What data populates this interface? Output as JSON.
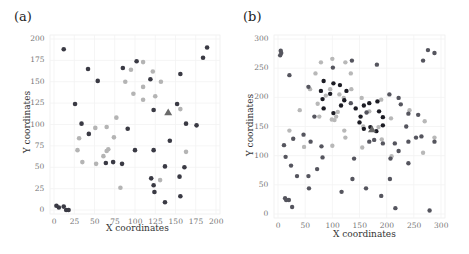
{
  "chart_data": [
    {
      "panel": "(a)",
      "type": "scatter",
      "title": "",
      "xlabel": "X coordinates",
      "ylabel": "Y coordinates",
      "xlim": [
        0,
        200
      ],
      "ylim": [
        0,
        200
      ],
      "xticks": [
        "0",
        "25",
        "50",
        "75",
        "100",
        "125",
        "150",
        "175",
        "200"
      ],
      "yticks": [
        "0",
        "25",
        "50",
        "75",
        "100",
        "125",
        "150",
        "175",
        "200"
      ],
      "grid": true,
      "legend": null,
      "colors": {
        "dark": "#3a3a44",
        "light": "#b4b4b4",
        "triangle": "#6a6a6a"
      },
      "series": [
        {
          "name": "dark",
          "marker": "circle",
          "points": [
            [
              12,
              188
            ],
            [
              42,
              165
            ],
            [
              54,
              151
            ],
            [
              26,
              124
            ],
            [
              34,
              101
            ],
            [
              43,
              89
            ],
            [
              102,
              174
            ],
            [
              85,
              166
            ],
            [
              91,
              95
            ],
            [
              100,
              70
            ],
            [
              64,
              55
            ],
            [
              73,
              56
            ],
            [
              84,
              54
            ],
            [
              119,
              153
            ],
            [
              123,
              117
            ],
            [
              156,
              159
            ],
            [
              152,
              124
            ],
            [
              163,
              101
            ],
            [
              176,
              99
            ],
            [
              143,
              81
            ],
            [
              123,
              70
            ],
            [
              137,
              51
            ],
            [
              120,
              37
            ],
            [
              123,
              29
            ],
            [
              124,
              21
            ],
            [
              137,
              9
            ],
            [
              155,
              39
            ],
            [
              161,
              50
            ],
            [
              156,
              16
            ],
            [
              184,
              178
            ],
            [
              189,
              190
            ],
            [
              3,
              5
            ],
            [
              6,
              3
            ],
            [
              12,
              4
            ],
            [
              15,
              0
            ],
            [
              18,
              0
            ]
          ]
        },
        {
          "name": "light",
          "marker": "circle",
          "points": [
            [
              110,
              173
            ],
            [
              95,
              164
            ],
            [
              122,
              162
            ],
            [
              88,
              150
            ],
            [
              110,
              144
            ],
            [
              132,
              150
            ],
            [
              98,
              136
            ],
            [
              110,
              129
            ],
            [
              125,
              133
            ],
            [
              156,
              118
            ],
            [
              77,
              108
            ],
            [
              51,
              96
            ],
            [
              65,
              97
            ],
            [
              31,
              84
            ],
            [
              74,
              85
            ],
            [
              29,
              70
            ],
            [
              67,
              71
            ],
            [
              65,
              69
            ],
            [
              61,
              63
            ],
            [
              35,
              56
            ],
            [
              52,
              54
            ],
            [
              163,
              68
            ],
            [
              131,
              35
            ],
            [
              82,
              26
            ]
          ]
        },
        {
          "name": "special",
          "marker": "triangle",
          "points": [
            [
              141,
              114
            ]
          ]
        }
      ]
    },
    {
      "panel": "(b)",
      "type": "scatter",
      "title": "",
      "xlabel": "X coordinates",
      "ylabel": "Y coordinates",
      "xlim": [
        0,
        300
      ],
      "ylim": [
        0,
        300
      ],
      "xticks": [
        "0",
        "50",
        "100",
        "150",
        "200",
        "250",
        "300"
      ],
      "yticks": [
        "0",
        "50",
        "100",
        "150",
        "200",
        "250",
        "300"
      ],
      "grid": true,
      "legend": null,
      "colors": {
        "black": "#1c1c24",
        "dark": "#55555e",
        "light": "#b8b8b8",
        "triangle": "#6a6a6a"
      },
      "series": [
        {
          "name": "black",
          "marker": "circle",
          "points": [
            [
              84,
              228
            ],
            [
              102,
              224
            ],
            [
              114,
              221
            ],
            [
              79,
              211
            ],
            [
              126,
              211
            ],
            [
              96,
              206
            ],
            [
              82,
              197
            ],
            [
              122,
              195
            ],
            [
              116,
              186
            ],
            [
              84,
              181
            ],
            [
              102,
              173
            ],
            [
              143,
              181
            ],
            [
              158,
              186
            ],
            [
              168,
              190
            ],
            [
              183,
              193
            ],
            [
              186,
              176
            ],
            [
              193,
              166
            ],
            [
              152,
              167
            ],
            [
              150,
              157
            ],
            [
              158,
              146
            ],
            [
              170,
              149
            ],
            [
              181,
              142
            ],
            [
              193,
              152
            ]
          ]
        },
        {
          "name": "dark",
          "marker": "circle",
          "points": [
            [
              5,
              280
            ],
            [
              6,
              276
            ],
            [
              4,
              272
            ],
            [
              136,
              263
            ],
            [
              101,
              251
            ],
            [
              182,
              256
            ],
            [
              21,
              238
            ],
            [
              276,
              281
            ],
            [
              288,
              276
            ],
            [
              267,
              263
            ],
            [
              56,
              218
            ],
            [
              205,
              205
            ],
            [
              222,
              199
            ],
            [
              226,
              188
            ],
            [
              134,
              190
            ],
            [
              67,
              167
            ],
            [
              258,
              170
            ],
            [
              240,
              172
            ],
            [
              236,
              150
            ],
            [
              11,
              118
            ],
            [
              14,
              98
            ],
            [
              28,
              129
            ],
            [
              47,
              136
            ],
            [
              60,
              124
            ],
            [
              80,
              116
            ],
            [
              82,
              97
            ],
            [
              24,
              83
            ],
            [
              35,
              65
            ],
            [
              56,
              65
            ],
            [
              72,
              77
            ],
            [
              137,
              60
            ],
            [
              57,
              44
            ],
            [
              117,
              38
            ],
            [
              140,
              95
            ],
            [
              162,
              44
            ],
            [
              190,
              31
            ],
            [
              216,
              10
            ],
            [
              279,
              6
            ],
            [
              26,
              12
            ],
            [
              13,
              27
            ],
            [
              15,
              24
            ],
            [
              20,
              24
            ],
            [
              207,
              95
            ],
            [
              222,
              108
            ],
            [
              240,
              87
            ],
            [
              206,
              60
            ],
            [
              240,
              124
            ],
            [
              254,
              131
            ],
            [
              264,
              133
            ],
            [
              288,
              124
            ],
            [
              215,
              121
            ],
            [
              193,
              121
            ],
            [
              168,
              124
            ],
            [
              177,
              127
            ],
            [
              163,
              174
            ]
          ]
        },
        {
          "name": "light",
          "marker": "circle",
          "points": [
            [
              79,
              260
            ],
            [
              100,
              266
            ],
            [
              124,
              260
            ],
            [
              134,
              241
            ],
            [
              69,
              241
            ],
            [
              59,
              214
            ],
            [
              96,
              214
            ],
            [
              135,
              214
            ],
            [
              73,
              189
            ],
            [
              88,
              203
            ],
            [
              113,
              205
            ],
            [
              121,
              199
            ],
            [
              110,
              175
            ],
            [
              107,
              167
            ],
            [
              99,
              162
            ],
            [
              76,
              167
            ],
            [
              104,
              161
            ],
            [
              40,
              178
            ],
            [
              21,
              143
            ],
            [
              48,
              115
            ],
            [
              100,
              117
            ],
            [
              122,
              143
            ],
            [
              124,
              131
            ],
            [
              154,
              199
            ],
            [
              168,
              176
            ],
            [
              190,
              196
            ],
            [
              208,
              164
            ],
            [
              242,
              178
            ],
            [
              270,
              159
            ],
            [
              288,
              131
            ],
            [
              267,
              105
            ],
            [
              191,
              128
            ],
            [
              155,
              114
            ],
            [
              209,
              99
            ],
            [
              185,
              149
            ],
            [
              157,
              150
            ]
          ]
        },
        {
          "name": "special",
          "marker": "triangle",
          "points": [
            [
              173,
              145
            ]
          ]
        }
      ]
    }
  ]
}
